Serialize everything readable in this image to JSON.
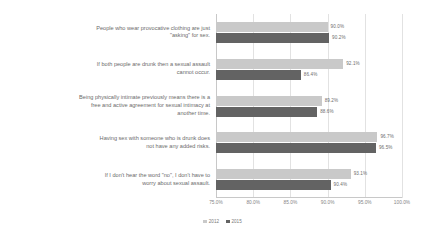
{
  "chart_data": {
    "type": "bar",
    "orientation": "horizontal",
    "title": "",
    "subtitle": "",
    "xlabel": "",
    "ylabel": "",
    "xlim": [
      75.0,
      100.0
    ],
    "xticks": [
      "75.0%",
      "80.0%",
      "85.0%",
      "90.0%",
      "95.0%",
      "100.0%"
    ],
    "xtick_values": [
      75.0,
      80.0,
      85.0,
      90.0,
      95.0,
      100.0
    ],
    "grid": true,
    "legend_position": "bottom-center",
    "categories": [
      "People who wear provocative clothing are just\n\"asking\" for sex.",
      "If both people are drunk then a sexual assault\ncannot occur.",
      "Being physically intimate previously means there is a\nfree and active agreement for sexual intimacy at\nanother time.",
      "Having sex with someone who is drunk does\nnot have any added risks.",
      "If I don't hear the word \"no\", I don't have to\nworry about sexual assault."
    ],
    "series": [
      {
        "name": "2012",
        "color": "#c9c9c9",
        "values": [
          90.0,
          92.1,
          89.2,
          96.7,
          93.1
        ],
        "labels": [
          "90.0%",
          "92.1%",
          "89.2%",
          "96.7%",
          "93.1%"
        ]
      },
      {
        "name": "2015",
        "color": "#636363",
        "values": [
          90.2,
          86.4,
          88.6,
          96.5,
          90.4
        ],
        "labels": [
          "90.2%",
          "86.4%",
          "88.6%",
          "96.5%",
          "90.4%"
        ]
      }
    ]
  },
  "legend": {
    "items": [
      {
        "label": "2012",
        "color": "#c9c9c9"
      },
      {
        "label": "2015",
        "color": "#636363"
      }
    ]
  },
  "colors": {
    "series_2012": "#c9c9c9",
    "series_2015": "#636363",
    "gridline": "#e2e2e2",
    "text": "#6b6b6b",
    "background": "#ffffff"
  }
}
